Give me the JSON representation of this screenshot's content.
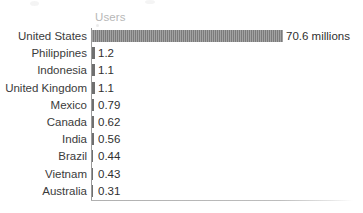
{
  "chart_data": {
    "type": "bar",
    "orientation": "horizontal",
    "title": "",
    "subtitle": "",
    "xlabel": "",
    "ylabel": "",
    "column_header": "Users",
    "unit_note": "millions",
    "grid": false,
    "legend": "none",
    "xlim": [
      0,
      70.6
    ],
    "categories": [
      "United States",
      "Philippines",
      "Indonesia",
      "United Kingdom",
      "Mexico",
      "Canada",
      "India",
      "Brazil",
      "Vietnam",
      "Australia"
    ],
    "values": [
      70.6,
      1.2,
      1.1,
      1.1,
      0.79,
      0.62,
      0.56,
      0.44,
      0.43,
      0.31
    ],
    "value_labels": [
      "70.6 millions",
      "1.2",
      "1.1",
      "1.1",
      "0.79",
      "0.62",
      "0.56",
      "0.44",
      "0.43",
      "0.31"
    ],
    "bar_color": "#7b7b7b",
    "axis_color": "#9a9a9a",
    "header_color": "#b7b7b7",
    "label_color": "#3b3b3b"
  },
  "rows": [
    {
      "category": "United States",
      "value_label": "70.6 millions",
      "bar_px": 191,
      "label_x": 286,
      "thin": false
    },
    {
      "category": "Philippines",
      "value_label": "1.2",
      "bar_px": 3,
      "label_x": 98,
      "thin": true
    },
    {
      "category": "Indonesia",
      "value_label": "1.1",
      "bar_px": 3,
      "label_x": 98,
      "thin": true
    },
    {
      "category": "United Kingdom",
      "value_label": "1.1",
      "bar_px": 3,
      "label_x": 98,
      "thin": true
    },
    {
      "category": "Mexico",
      "value_label": "0.79",
      "bar_px": 2,
      "label_x": 98,
      "thin": true
    },
    {
      "category": "Canada",
      "value_label": "0.62",
      "bar_px": 2,
      "label_x": 98,
      "thin": true
    },
    {
      "category": "India",
      "value_label": "0.56",
      "bar_px": 2,
      "label_x": 98,
      "thin": true
    },
    {
      "category": "Brazil",
      "value_label": "0.44",
      "bar_px": 1,
      "label_x": 98,
      "thin": true
    },
    {
      "category": "Vietnam",
      "value_label": "0.43",
      "bar_px": 1,
      "label_x": 98,
      "thin": true
    },
    {
      "category": "Australia",
      "value_label": "0.31",
      "bar_px": 1,
      "label_x": 98,
      "thin": true
    }
  ]
}
